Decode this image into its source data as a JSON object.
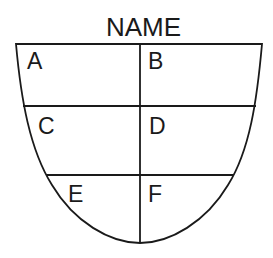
{
  "diagram": {
    "title": "NAME",
    "stroke_color": "#1a1a1a",
    "background": "#ffffff",
    "cells": [
      {
        "id": "A",
        "label": "A",
        "row": 1,
        "column": "left"
      },
      {
        "id": "B",
        "label": "B",
        "row": 1,
        "column": "right"
      },
      {
        "id": "C",
        "label": "C",
        "row": 2,
        "column": "left"
      },
      {
        "id": "D",
        "label": "D",
        "row": 2,
        "column": "right"
      },
      {
        "id": "E",
        "label": "E",
        "row": 3,
        "column": "left"
      },
      {
        "id": "F",
        "label": "F",
        "row": 3,
        "column": "right"
      }
    ]
  }
}
